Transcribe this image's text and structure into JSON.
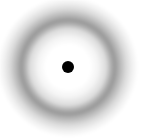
{
  "image": {
    "description": "Blurred gray ring with a solid black central dot on white background",
    "colors": {
      "background": "#ffffff",
      "ring": "#9a9a9a",
      "dot": "#000000"
    },
    "center": [
      68,
      67
    ],
    "ring_radius_px": 46,
    "dot_diameter_px": 12
  }
}
